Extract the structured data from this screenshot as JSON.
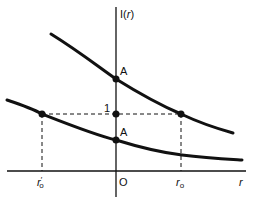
{
  "figure": {
    "y_axis_label": "I(r)",
    "y_axis_label_func": "I(",
    "y_axis_label_var": "r",
    "y_axis_label_close": ")",
    "x_axis_label": "r",
    "origin_label": "O",
    "unit_tick_label": "1",
    "upper_intercept_label": "A",
    "lower_intercept_label": "A",
    "r0_label": "r",
    "r0_subscript": "o",
    "r0_prime_label": "r",
    "r0_prime_mark": "′",
    "r0_prime_subscript": "o"
  },
  "colors": {
    "curve": "#111111",
    "axis": "#111111",
    "background": "#ffffff"
  }
}
